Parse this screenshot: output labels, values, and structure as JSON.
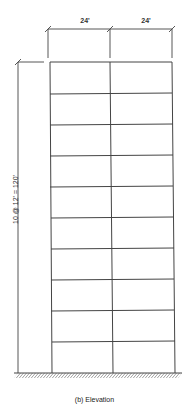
{
  "diagram": {
    "title": "Elevation",
    "caption": "(b) Elevation",
    "bays": [
      {
        "label": "24'",
        "width_ft": 24
      },
      {
        "label": "24'",
        "width_ft": 24
      }
    ],
    "stories": {
      "count": 10,
      "story_height_ft": 12,
      "total_height_ft": 120,
      "dimension_label": "10 @ 12' = 120'"
    },
    "colors": {
      "line": "#444444",
      "background": "#ffffff"
    }
  }
}
